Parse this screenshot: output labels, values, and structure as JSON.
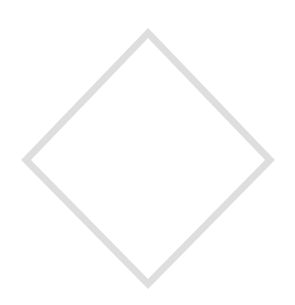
{
  "canvas": {
    "width": 295,
    "height": 305,
    "background_color": "#ffffff",
    "title": "Diamond Outline"
  },
  "shape": {
    "name": "diamond",
    "icon_name": "diamond-outline-icon",
    "type": "polygon",
    "sides": 4,
    "stroke_color": "#dedede",
    "stroke_width": 7,
    "fill_color": "none",
    "stroke_linejoin": "miter",
    "vertices": [
      {
        "label": "top",
        "x": 148,
        "y": 33
      },
      {
        "label": "right",
        "x": 270,
        "y": 160
      },
      {
        "label": "bottom",
        "x": 148,
        "y": 284
      },
      {
        "label": "left",
        "x": 26,
        "y": 160
      }
    ],
    "points_attr": "148,33 270,160 148,284 26,160",
    "bounding_box": {
      "x": 26,
      "y": 33,
      "width": 244,
      "height": 251
    },
    "center": {
      "x": 148,
      "y": 158
    }
  }
}
